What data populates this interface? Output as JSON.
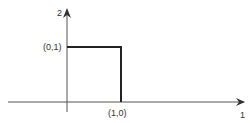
{
  "diagram": {
    "colors": {
      "axis": "#555555",
      "pulse": "#222222",
      "text": "#333333",
      "background": "#ffffff"
    },
    "y_axis": {
      "label": "2"
    },
    "x_axis": {
      "label": "1"
    },
    "points": [
      {
        "label": "(0,1)",
        "x": 0,
        "y": 1
      },
      {
        "label": "(1,0)",
        "x": 1,
        "y": 0
      }
    ]
  }
}
